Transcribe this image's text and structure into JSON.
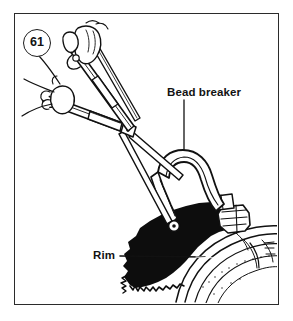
{
  "figure": {
    "number": "61",
    "kind": "technical-line-illustration",
    "frame": {
      "visible": true,
      "border_color": "#2b2b2b"
    },
    "background_color": "#ffffff",
    "ink_color": "#111111"
  },
  "labels": {
    "bead_breaker": "Bead breaker",
    "rim": "Rim"
  },
  "leaders": {
    "bead_breaker": {
      "orientation": "vertical",
      "from": "label-bottom",
      "to": "tool-arch-top"
    },
    "rim": {
      "orientation": "horizontal",
      "from": "label-right",
      "to": "wheel-rim-edge"
    }
  },
  "illustration_parts": [
    {
      "name": "upper-hand",
      "description": "Hand gripping the upper tool handle"
    },
    {
      "name": "lower-hand",
      "description": "Hand gripping the lower tool handle"
    },
    {
      "name": "upper-handle",
      "description": "Upper lever arm of the bead breaker"
    },
    {
      "name": "lower-handle",
      "description": "Lower lever arm of the bead breaker"
    },
    {
      "name": "pivot-joint",
      "description": "Central pivot linking the two lever arms"
    },
    {
      "name": "linkage-arm",
      "description": "Connecting link from pivot to the breaker foot"
    },
    {
      "name": "breaker-arch",
      "description": "Curved arch body of the bead breaker"
    },
    {
      "name": "breaker-foot",
      "description": "Shoe pressing down on the tire bead"
    },
    {
      "name": "tire",
      "description": "Solid black tire sidewall"
    },
    {
      "name": "wheel-rim",
      "description": "Concentric curved wheel rim with spokes"
    }
  ]
}
